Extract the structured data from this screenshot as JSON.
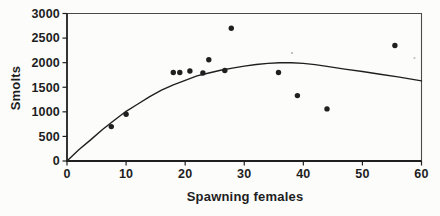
{
  "figure": {
    "background": "#fcfcfb",
    "ink_color": "#1f1f1f",
    "frame_color": "#4a4a4a",
    "speckles": [
      {
        "x": 292,
        "y": 53,
        "color": "#b5b2ad"
      },
      {
        "x": 414.5,
        "y": 58,
        "color": "#c0bdb8"
      }
    ]
  },
  "chart_data": {
    "type": "scatter",
    "title": "",
    "xlabel": "Spawning females",
    "ylabel": "Smolts",
    "xlim": [
      0,
      60
    ],
    "ylim": [
      0,
      3000
    ],
    "x_ticks": [
      0,
      10,
      20,
      30,
      40,
      50,
      60
    ],
    "y_ticks": [
      0,
      500,
      1000,
      1500,
      2000,
      2500,
      3000
    ],
    "grid": false,
    "legend_position": "none",
    "series": [
      {
        "name": "observed-smolt-production",
        "type": "scatter",
        "marker": "filled-circle",
        "points": [
          [
            7.5,
            700
          ],
          [
            10,
            950
          ],
          [
            18,
            1800
          ],
          [
            19.1,
            1800
          ],
          [
            20.8,
            1830
          ],
          [
            23,
            1790
          ],
          [
            24,
            2060
          ],
          [
            26.7,
            1840
          ],
          [
            27.8,
            2700
          ],
          [
            35.8,
            1800
          ],
          [
            39,
            1330
          ],
          [
            44,
            1060
          ],
          [
            55.5,
            2350
          ]
        ]
      },
      {
        "name": "fitted-recruitment-curve",
        "type": "line",
        "points": [
          [
            0,
            0
          ],
          [
            2,
            230
          ],
          [
            4,
            430
          ],
          [
            6,
            640
          ],
          [
            8,
            830
          ],
          [
            10,
            1010
          ],
          [
            12,
            1160
          ],
          [
            14,
            1310
          ],
          [
            16,
            1440
          ],
          [
            18,
            1550
          ],
          [
            20,
            1640
          ],
          [
            22,
            1730
          ],
          [
            24,
            1790
          ],
          [
            26,
            1845
          ],
          [
            28,
            1890
          ],
          [
            30,
            1930
          ],
          [
            32,
            1962
          ],
          [
            34,
            1985
          ],
          [
            36,
            1997
          ],
          [
            38,
            1997
          ],
          [
            40,
            1985
          ],
          [
            42,
            1960
          ],
          [
            44,
            1925
          ],
          [
            47,
            1870
          ],
          [
            50,
            1820
          ],
          [
            53,
            1765
          ],
          [
            56,
            1710
          ],
          [
            60,
            1630
          ]
        ]
      }
    ]
  }
}
